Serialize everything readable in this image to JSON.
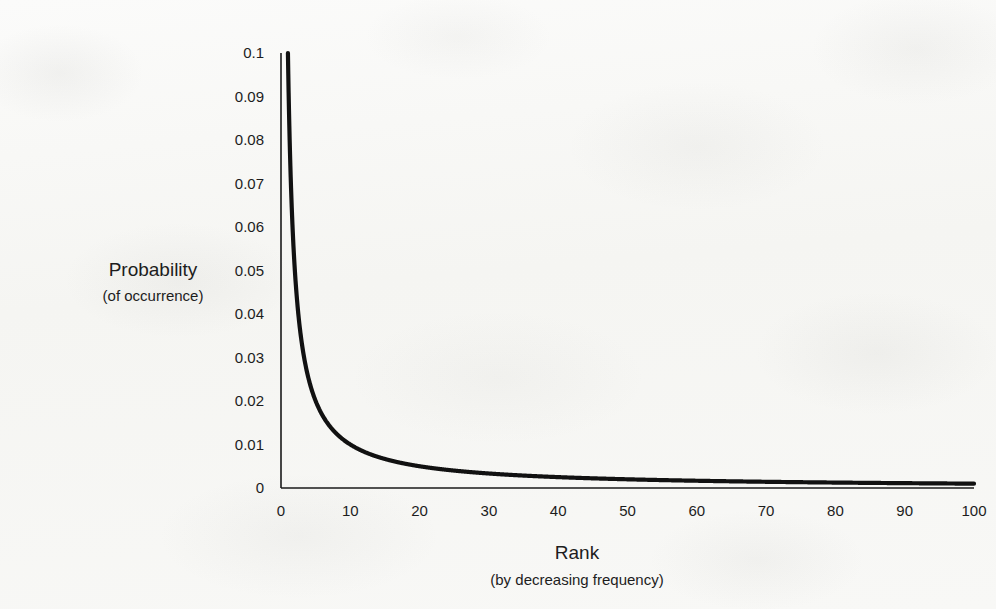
{
  "chart_data": {
    "type": "line",
    "title": "",
    "xlabel": "Rank",
    "xlabel_sub": "(by decreasing frequency)",
    "ylabel": "Probability",
    "ylabel_sub": "(of occurrence)",
    "xlim": [
      0,
      100
    ],
    "ylim": [
      0,
      0.1
    ],
    "grid": false,
    "legend": null,
    "x_ticks": [
      "0",
      "10",
      "20",
      "30",
      "40",
      "50",
      "60",
      "70",
      "80",
      "90",
      "100"
    ],
    "y_ticks": [
      "0.1",
      "0.09",
      "0.08",
      "0.07",
      "0.06",
      "0.05",
      "0.04",
      "0.03",
      "0.02",
      "0.01",
      "0"
    ],
    "x_tick_values": [
      0,
      10,
      20,
      30,
      40,
      50,
      60,
      70,
      80,
      90,
      100
    ],
    "y_tick_values": [
      0.1,
      0.09,
      0.08,
      0.07,
      0.06,
      0.05,
      0.04,
      0.03,
      0.02,
      0.01,
      0
    ],
    "series": [
      {
        "name": "Zipf distribution",
        "formula": "p(rank) = 0.1 / rank",
        "color": "#111111",
        "x": [
          1,
          2,
          3,
          4,
          5,
          6,
          7,
          8,
          9,
          10,
          12,
          14,
          16,
          18,
          20,
          25,
          30,
          35,
          40,
          45,
          50,
          55,
          60,
          65,
          70,
          75,
          80,
          85,
          90,
          95,
          100
        ],
        "values": [
          0.1,
          0.05,
          0.0333,
          0.025,
          0.02,
          0.0167,
          0.0143,
          0.0125,
          0.0111,
          0.01,
          0.0083,
          0.0071,
          0.0063,
          0.0056,
          0.005,
          0.004,
          0.0033,
          0.0029,
          0.0025,
          0.0022,
          0.002,
          0.0018,
          0.0017,
          0.0015,
          0.0014,
          0.0013,
          0.0013,
          0.0012,
          0.0011,
          0.0011,
          0.001
        ]
      }
    ]
  },
  "axes": {
    "x_axis_name": "rank-axis",
    "y_axis_name": "probability-axis"
  },
  "colors": {
    "curve": "#111111",
    "axis": "#1a1a1a",
    "text": "#1d1d1d",
    "background": "#f7f7f5"
  }
}
